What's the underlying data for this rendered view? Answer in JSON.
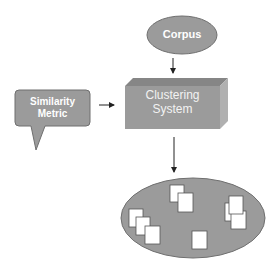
{
  "diagram": {
    "nodes": {
      "corpus": {
        "label": "Corpus",
        "shape": "ellipse"
      },
      "similarity_metric": {
        "label_line1": "Similarity",
        "label_line2": "Metric",
        "shape": "callout"
      },
      "clustering_system": {
        "label_line1": "Clustering",
        "label_line2": "System",
        "shape": "3d-box"
      },
      "clusters": {
        "label": "",
        "shape": "ellipse",
        "contents": "document clusters"
      }
    },
    "edges": [
      {
        "from": "corpus",
        "to": "clustering_system"
      },
      {
        "from": "similarity_metric",
        "to": "clustering_system"
      },
      {
        "from": "clustering_system",
        "to": "clusters"
      }
    ],
    "documents": [
      {
        "cluster": 1,
        "x": 129,
        "y": 209
      },
      {
        "cluster": 1,
        "x": 136,
        "y": 217
      },
      {
        "cluster": 1,
        "x": 145,
        "y": 226
      },
      {
        "cluster": 2,
        "x": 170,
        "y": 185
      },
      {
        "cluster": 2,
        "x": 178,
        "y": 193
      },
      {
        "cluster": 3,
        "x": 225,
        "y": 203
      },
      {
        "cluster": 3,
        "x": 231,
        "y": 211
      },
      {
        "cluster": 3,
        "x": 229,
        "y": 196
      },
      {
        "cluster": 4,
        "x": 192,
        "y": 231
      }
    ],
    "colors": {
      "fill": "#9b9b9b",
      "stroke": "#6f6f6f",
      "box_top": "#868686",
      "box_side": "#b0b0b0",
      "arrow": "#222222",
      "label": "#ffffff"
    }
  }
}
